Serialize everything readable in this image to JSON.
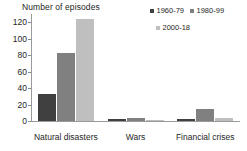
{
  "chart_data": {
    "type": "bar",
    "title": "Number of episodes",
    "xlabel": "",
    "ylabel": "Number of episodes",
    "categories": [
      "Natural disasters",
      "Wars",
      "Financial crises"
    ],
    "series": [
      {
        "name": "1960-79",
        "color": "#404040",
        "values": [
          33,
          3,
          2
        ]
      },
      {
        "name": "1980-99",
        "color": "#808080",
        "values": [
          83,
          4,
          15
        ]
      },
      {
        "name": "2000-18",
        "color": "#bfbfbf",
        "values": [
          124,
          1,
          4
        ]
      }
    ],
    "ylim": [
      0,
      130
    ],
    "yticks": [
      0,
      20,
      40,
      60,
      80,
      100,
      120
    ],
    "ytick_labels": [
      "0",
      "20",
      "40",
      "60",
      "80",
      "100",
      "120"
    ],
    "grid": false,
    "legend_position": "top-right"
  },
  "axis": {
    "title": "Number of episodes"
  },
  "legend": {
    "items": [
      {
        "label": "1960-79",
        "color": "#404040"
      },
      {
        "label": "1980-99",
        "color": "#808080"
      },
      {
        "label": "2000-18",
        "color": "#bfbfbf"
      }
    ]
  }
}
